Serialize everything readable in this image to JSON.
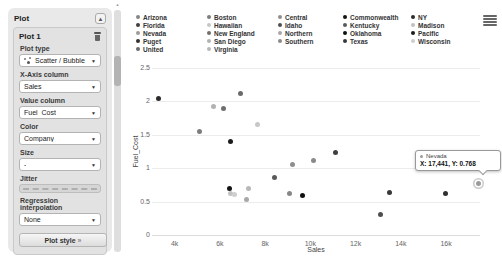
{
  "sidebar": {
    "title": "Plot",
    "plot_name": "Plot 1",
    "plot_type_label": "Plot type",
    "plot_type_value": "Scatter / Bubble",
    "xaxis_label": "X-Axis column",
    "xaxis_value": "Sales",
    "value_label": "Value column",
    "value_value": "Fuel_Cost",
    "color_label": "Color",
    "color_value": "Company",
    "size_label": "Size",
    "size_value": "-",
    "jitter_label": "Jitter",
    "regression_label": "Regression interpolation",
    "regression_value": "None",
    "plot_style_button": "Plot style",
    "plot_style_chevron": "»"
  },
  "tooltip": {
    "series": "Nevada",
    "value_text": "X: 17,441, Y: 0.768"
  },
  "chart_data": {
    "type": "scatter",
    "xlabel": "Sales",
    "ylabel": "Fuel_Cost",
    "xlim": [
      3000,
      17500
    ],
    "ylim": [
      0,
      2.5
    ],
    "grid": "horizontal",
    "legend_position": "top",
    "x_ticks": [
      {
        "v": 4000,
        "label": "4k"
      },
      {
        "v": 6000,
        "label": "6k"
      },
      {
        "v": 8000,
        "label": "8k"
      },
      {
        "v": 10000,
        "label": "10k"
      },
      {
        "v": 12000,
        "label": "12k"
      },
      {
        "v": 14000,
        "label": "14k"
      },
      {
        "v": 16000,
        "label": "16k"
      }
    ],
    "y_ticks": [
      {
        "v": 0,
        "label": "0"
      },
      {
        "v": 0.5,
        "label": "0.5"
      },
      {
        "v": 1,
        "label": "1"
      },
      {
        "v": 1.5,
        "label": "1.5"
      },
      {
        "v": 2,
        "label": "2"
      },
      {
        "v": 2.5,
        "label": "2.5"
      }
    ],
    "legend_columns": [
      [
        "Arizona",
        "Florida",
        "Nevada",
        "Puget",
        "United"
      ],
      [
        "Boston",
        "Hawaiian",
        "New England",
        "San Diego",
        "Virginia"
      ],
      [
        "Central",
        "Idaho",
        "Northern",
        "Southern"
      ],
      [
        "Commonwealth",
        "Kentucky",
        "Oklahoma",
        "Texas"
      ],
      [
        "NY",
        "Madison",
        "Pacific",
        "Wisconsin"
      ]
    ],
    "colors": {
      "Arizona": "#878787",
      "Boston": "#7d7d7d",
      "Central": "#8f8f8f",
      "Commonwealth": "#141414",
      "NY": "#2b2b2b",
      "Florida": "#3f3f3f",
      "Hawaiian": "#c7c7c7",
      "Idaho": "#4f4f4f",
      "Kentucky": "#5a5a5a",
      "Madison": "#c2c2c2",
      "Nevada": "#9b9b9b",
      "New England": "#6f6f6f",
      "Northern": "#a8a8a8",
      "Oklahoma": "#101010",
      "Pacific": "#1c1c1c",
      "Puget": "#303030",
      "San Diego": "#b2b2b2",
      "Southern": "#8a8a8a",
      "Texas": "#383838",
      "United": "#6a6a6a",
      "Virginia": "#b8b8b8",
      "Wisconsin": "#cfcfcf"
    },
    "points": [
      {
        "company": "NY",
        "x": 3300,
        "y": 2.044
      },
      {
        "company": "Boston",
        "x": 5088,
        "y": 1.555
      },
      {
        "company": "San Diego",
        "x": 5714,
        "y": 1.92
      },
      {
        "company": "New England",
        "x": 6154,
        "y": 1.897
      },
      {
        "company": "Commonwealth",
        "x": 6423,
        "y": 0.7
      },
      {
        "company": "Madison",
        "x": 6455,
        "y": 0.623
      },
      {
        "company": "Pacific",
        "x": 6468,
        "y": 1.4
      },
      {
        "company": "Wisconsin",
        "x": 6650,
        "y": 0.605
      },
      {
        "company": "United",
        "x": 6905,
        "y": 2.116
      },
      {
        "company": "Northern",
        "x": 7179,
        "y": 0.527
      },
      {
        "company": "Virginia",
        "x": 7287,
        "y": 0.702
      },
      {
        "company": "Hawaiian",
        "x": 7642,
        "y": 1.652
      },
      {
        "company": "Kentucky",
        "x": 8406,
        "y": 0.862
      },
      {
        "company": "Arizona",
        "x": 9077,
        "y": 0.628
      },
      {
        "company": "Central",
        "x": 9212,
        "y": 1.058
      },
      {
        "company": "Oklahoma",
        "x": 9673,
        "y": 0.588
      },
      {
        "company": "Southern",
        "x": 10140,
        "y": 1.108
      },
      {
        "company": "Florida",
        "x": 11127,
        "y": 1.241
      },
      {
        "company": "Idaho",
        "x": 13082,
        "y": 0.309
      },
      {
        "company": "Texas",
        "x": 13507,
        "y": 0.636
      },
      {
        "company": "Puget",
        "x": 15991,
        "y": 0.62
      },
      {
        "company": "Nevada",
        "x": 17441,
        "y": 0.768,
        "highlighted": true
      }
    ]
  }
}
